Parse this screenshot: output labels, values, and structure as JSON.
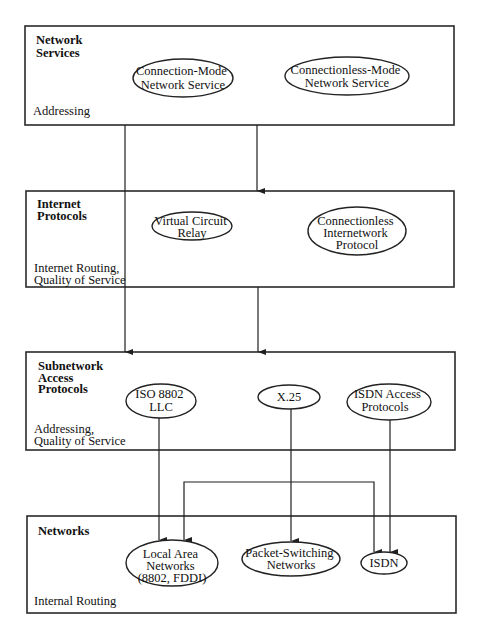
{
  "diagram": {
    "layers": [
      {
        "id": "network-services",
        "title_lines": [
          "Network",
          "Services"
        ],
        "note_lines": [
          "Addressing"
        ],
        "nodes": [
          {
            "id": "cmns",
            "lines": [
              "Connection-Mode",
              "Network Service"
            ]
          },
          {
            "id": "clns",
            "lines": [
              "Connectionless-Mode",
              "Network Service"
            ]
          }
        ]
      },
      {
        "id": "internet-protocols",
        "title_lines": [
          "Internet",
          "Protocols"
        ],
        "note_lines": [
          "Internet Routing,",
          "Quality of Service"
        ],
        "nodes": [
          {
            "id": "vcr",
            "lines": [
              "Virtual Circuit",
              "Relay"
            ]
          },
          {
            "id": "clnp",
            "lines": [
              "Connectionless",
              "Internetwork",
              "Protocol"
            ]
          }
        ]
      },
      {
        "id": "subnetwork-access-protocols",
        "title_lines": [
          "Subnetwork",
          "Access",
          "Protocols"
        ],
        "note_lines": [
          "Addressing,",
          "Quality of Service"
        ],
        "nodes": [
          {
            "id": "iso8802",
            "lines": [
              "ISO 8802",
              "LLC"
            ]
          },
          {
            "id": "x25",
            "lines": [
              "X.25"
            ]
          },
          {
            "id": "isdn-access",
            "lines": [
              "ISDN Access",
              "Protocols"
            ]
          }
        ]
      },
      {
        "id": "networks",
        "title_lines": [
          "Networks"
        ],
        "note_lines": [
          "Internal Routing"
        ],
        "nodes": [
          {
            "id": "lan",
            "lines": [
              "Local Area",
              "Networks",
              "(8802, FDDI)"
            ]
          },
          {
            "id": "psn",
            "lines": [
              "Packet-Switching",
              "Networks"
            ]
          },
          {
            "id": "isdn",
            "lines": [
              "ISDN"
            ]
          }
        ]
      }
    ],
    "connections": [
      {
        "from": "network-services",
        "to": "subnetwork-access-protocols",
        "note": "left line passes through internet-protocols layer"
      },
      {
        "from": "network-services",
        "to": "internet-protocols"
      },
      {
        "from": "internet-protocols",
        "to": "subnetwork-access-protocols"
      },
      {
        "from": "iso8802",
        "to": "lan"
      },
      {
        "from": "x25",
        "to": "psn"
      },
      {
        "from": "isdn-access",
        "to": "isdn"
      },
      {
        "from": "isdn",
        "to": "lan",
        "note": "bracket connector with arrowheads at both ends"
      }
    ]
  }
}
